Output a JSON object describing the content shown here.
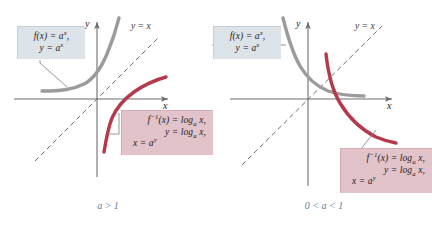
{
  "figure": {
    "type": "math-figure"
  },
  "colors": {
    "exponential_curve": "#9b9b9b",
    "logarithmic_curve": "#b5394a",
    "identity_line": "#6e6e6e",
    "axis": "#6e6e6e",
    "callout_blue_bg": "#dde4e9",
    "callout_pink_bg": "#e2c3ca",
    "caption_text": "#5b7f9e",
    "leader_line": "#8a8a8a"
  },
  "panels": [
    {
      "id": "left",
      "caption": "a > 1",
      "axis_x_label": "x",
      "axis_y_label": "y",
      "identity_label": "y = x",
      "exp_callout": {
        "line1_prefix": "f(x) = a",
        "line1_exp": "x",
        "line1_suffix": ",",
        "line2_prefix": "y = a",
        "line2_exp": "x"
      },
      "log_callout": {
        "line1_prefix": "f",
        "line1_sup": "−1",
        "line1_mid": "(x) = log",
        "line1_sub": "a",
        "line1_suffix": " x,",
        "line2_prefix": "y = log",
        "line2_sub": "a",
        "line2_suffix": " x,",
        "line3_prefix": "x = a",
        "line3_exp": "y"
      }
    },
    {
      "id": "right",
      "caption": "0 < a < 1",
      "axis_x_label": "x",
      "axis_y_label": "y",
      "identity_label": "y = x",
      "exp_callout": {
        "line1_prefix": "f(x) = a",
        "line1_exp": "x",
        "line1_suffix": ",",
        "line2_prefix": "y = a",
        "line2_exp": "x"
      },
      "log_callout": {
        "line1_prefix": "f",
        "line1_sup": "−1",
        "line1_mid": "(x) = log",
        "line1_sub": "a",
        "line1_suffix": " x,",
        "line2_prefix": "y = log",
        "line2_sub": "a",
        "line2_suffix": " x,",
        "line3_prefix": "x = a",
        "line3_exp": "y"
      }
    }
  ]
}
